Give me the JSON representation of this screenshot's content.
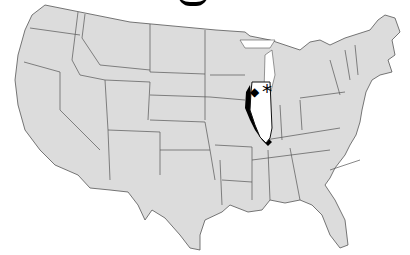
{
  "map": {
    "region": "United States (contiguous)",
    "highlighted_state": "Illinois",
    "colors": {
      "states_fill": "#dcdcdc",
      "borders": "#555555",
      "highlight_fill": "#ffffff",
      "highlight_shadow": "#000000",
      "background": "#ffffff"
    },
    "markers": [
      {
        "symbol": "*",
        "label": "Chicago",
        "type": "star"
      },
      {
        "symbol": "◆",
        "label": "",
        "type": "diamond"
      }
    ]
  }
}
